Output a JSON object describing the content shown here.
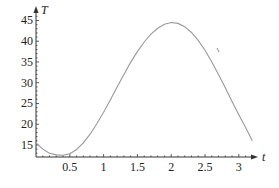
{
  "chart_data": {
    "type": "line",
    "title": "",
    "xlabel": "t",
    "ylabel": "T",
    "xlim": [
      0,
      3.2
    ],
    "ylim": [
      12,
      46
    ],
    "grid": false,
    "legend": null,
    "x_ticks": [
      0.5,
      1,
      1.5,
      2,
      2.5,
      3
    ],
    "x_tick_labels": [
      "0.5",
      "1",
      "1.5",
      "2",
      "2.5",
      "3"
    ],
    "y_ticks": [
      15,
      20,
      25,
      30,
      35,
      40,
      45
    ],
    "y_tick_labels": [
      "15",
      "20",
      "25",
      "30",
      "35",
      "40",
      "45"
    ],
    "series": [
      {
        "name": "T(t)",
        "color": "#999999",
        "x": [
          0,
          0.1,
          0.2,
          0.3,
          0.4,
          0.5,
          0.6,
          0.7,
          0.8,
          0.9,
          1.0,
          1.1,
          1.2,
          1.3,
          1.4,
          1.5,
          1.6,
          1.7,
          1.8,
          1.9,
          2.0,
          2.1,
          2.2,
          2.3,
          2.4,
          2.5,
          2.6,
          2.7,
          2.8,
          2.9,
          3.0,
          3.1,
          3.2
        ],
        "values": [
          15.5,
          14.0,
          13.0,
          12.6,
          12.5,
          12.9,
          13.9,
          15.5,
          17.6,
          20.1,
          22.9,
          25.9,
          29.0,
          32.0,
          34.9,
          37.5,
          39.8,
          41.7,
          43.1,
          44.1,
          44.5,
          44.3,
          43.5,
          42.1,
          40.2,
          37.8,
          35.0,
          32.0,
          28.8,
          25.5,
          22.3,
          19.2,
          16.0
        ]
      }
    ]
  }
}
